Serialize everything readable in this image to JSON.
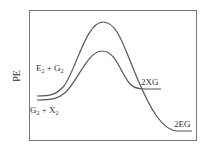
{
  "diagram": {
    "type": "potential-energy-diagram",
    "y_axis_label": "PE",
    "colors": {
      "line": "#555555",
      "frame": "#777777",
      "text": "#333333",
      "background": "#ffffff"
    },
    "curves": [
      {
        "name": "upper",
        "reactants_label": "E",
        "reactants_sub1": "2",
        "reactants_plus": " + G",
        "reactants_sub2": "2",
        "products_label": "2EG"
      },
      {
        "name": "lower",
        "reactants_label": "G",
        "reactants_sub1": "2",
        "reactants_plus": " + X",
        "reactants_sub2": "2",
        "products_label": "2XG"
      }
    ]
  }
}
